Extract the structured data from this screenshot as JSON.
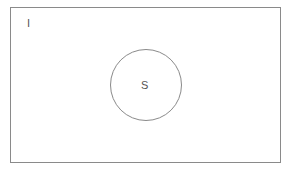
{
  "diagram": {
    "type": "venn",
    "universe": {
      "label": "I"
    },
    "sets": [
      {
        "label": "S"
      }
    ],
    "colors": {
      "stroke": "#8a8a8a",
      "text": "#555555",
      "background": "#ffffff"
    }
  }
}
